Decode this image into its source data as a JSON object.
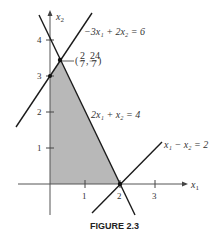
{
  "figure": {
    "caption": "FIGURE 2.3",
    "axes": {
      "x_label": "x",
      "x_sub": "1",
      "y_label": "x",
      "y_sub": "2",
      "x_ticks": [
        "1",
        "2",
        "3"
      ],
      "y_ticks": [
        "1",
        "2",
        "3",
        "4"
      ]
    },
    "lines": [
      {
        "id": "l1",
        "equation": "−3x₁ + 2x₂ = 6"
      },
      {
        "id": "l2",
        "equation": "2x₁ + x₂ = 4"
      },
      {
        "id": "l3",
        "equation": "x₁ − x₂ = 2"
      }
    ],
    "vertex_label": "(2/7, 24/7)",
    "vertex_num_x": "2",
    "vertex_den_x": "7",
    "vertex_num_y": "24",
    "vertex_den_y": "7",
    "colors": {
      "region": "#b5b5b5",
      "line": "#1a1a1a",
      "axis": "#555555"
    }
  }
}
